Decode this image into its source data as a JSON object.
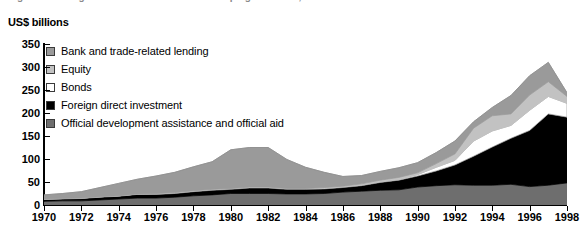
{
  "title_remnant": "Figure: Net long-term resource flows to developing countries, 1970-1998",
  "axis_title": "US$ billions",
  "legend": {
    "items": [
      {
        "label": "Bank and trade-related lending",
        "color": "#9a9a9a",
        "key": "bank"
      },
      {
        "label": "Equity",
        "color": "#c2c2c2",
        "key": "equity"
      },
      {
        "label": "Bonds",
        "color": "#ffffff",
        "key": "bonds"
      },
      {
        "label": "Foreign direct investment",
        "color": "#000000",
        "key": "fdi"
      },
      {
        "label": "Official development assistance and official aid",
        "color": "#6e6e6e",
        "key": "oda"
      }
    ]
  },
  "chart_data": {
    "type": "area",
    "stacked": true,
    "title": "",
    "xlabel": "",
    "ylabel": "US$ billions",
    "ylim": [
      0,
      350
    ],
    "ytick_step": 50,
    "yticks": [
      0,
      50,
      100,
      150,
      200,
      250,
      300,
      350
    ],
    "xlim": [
      1970,
      1998
    ],
    "grid": false,
    "legend_position": "upper-left-inside",
    "x": [
      1970,
      1971,
      1972,
      1973,
      1974,
      1975,
      1976,
      1977,
      1978,
      1979,
      1980,
      1981,
      1982,
      1983,
      1984,
      1985,
      1986,
      1987,
      1988,
      1989,
      1990,
      1991,
      1992,
      1993,
      1994,
      1995,
      1996,
      1997,
      1998
    ],
    "series": [
      {
        "name": "Official development assistance and official aid",
        "color": "#6e6e6e",
        "values": [
          8,
          9,
          9,
          11,
          13,
          15,
          15,
          17,
          20,
          22,
          25,
          25,
          25,
          24,
          24,
          25,
          28,
          30,
          32,
          33,
          39,
          42,
          44,
          43,
          43,
          45,
          40,
          43,
          48
        ]
      },
      {
        "name": "Foreign direct investment",
        "color": "#000000",
        "values": [
          4,
          4,
          5,
          6,
          6,
          8,
          8,
          8,
          9,
          10,
          9,
          12,
          12,
          10,
          10,
          10,
          10,
          12,
          17,
          21,
          24,
          32,
          43,
          63,
          83,
          100,
          122,
          155,
          143
        ]
      },
      {
        "name": "Bonds",
        "color": "#ffffff",
        "values": [
          1,
          1,
          1,
          1,
          1,
          1,
          2,
          2,
          2,
          2,
          2,
          2,
          2,
          2,
          2,
          2,
          2,
          2,
          2,
          2,
          3,
          8,
          10,
          33,
          35,
          28,
          44,
          38,
          30
        ]
      },
      {
        "name": "Equity",
        "color": "#c2c2c2",
        "values": [
          0,
          0,
          0,
          0,
          0,
          0,
          0,
          0,
          0,
          0,
          0,
          0,
          0,
          0,
          0,
          1,
          1,
          2,
          3,
          4,
          4,
          8,
          14,
          28,
          33,
          25,
          33,
          32,
          15
        ]
      },
      {
        "name": "Bank and trade-related lending",
        "color": "#9a9a9a",
        "values": [
          9,
          11,
          14,
          20,
          27,
          32,
          38,
          44,
          52,
          60,
          84,
          86,
          86,
          63,
          46,
          33,
          21,
          18,
          19,
          21,
          22,
          24,
          28,
          14,
          18,
          40,
          42,
          42,
          8
        ]
      }
    ],
    "totals": [
      22,
      25,
      29,
      38,
      47,
      56,
      63,
      71,
      83,
      94,
      120,
      125,
      125,
      99,
      82,
      71,
      62,
      64,
      73,
      81,
      92,
      114,
      139,
      181,
      212,
      238,
      281,
      310,
      244
    ]
  }
}
